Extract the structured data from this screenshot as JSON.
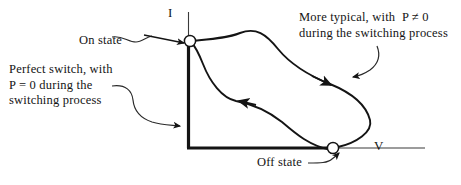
{
  "figure": {
    "type": "iv-switching-trajectory-diagram",
    "background_color": "#ffffff",
    "ink_color": "#141414",
    "axes": {
      "vertical_label": "I",
      "horizontal_label": "V",
      "origin_px": [
        188,
        148
      ],
      "vertical_top_px": [
        188,
        12
      ],
      "horizontal_right_px": [
        425,
        148
      ]
    },
    "markers": [
      {
        "name": "on-state",
        "label": "On state",
        "position_px": [
          190,
          41
        ],
        "style": "hollow-circle"
      },
      {
        "name": "off-state",
        "label": "Off state",
        "position_px": [
          333,
          148
        ],
        "style": "hollow-circle"
      }
    ],
    "annotations": [
      {
        "name": "perfect-switch",
        "lines": [
          "Perfect switch, with",
          "P = 0 during the",
          "switching process"
        ],
        "text": "Perfect switch, with\nP = 0 during the\nswitching process",
        "points_to": "perfect-switch-path-along-axes"
      },
      {
        "name": "more-typical",
        "lines": [
          "More typical, with  P ≠ 0",
          "during the switching process"
        ],
        "text": "More typical, with  P ≠ 0\nduring the switching process",
        "points_to": "curved-switching-trajectory"
      }
    ],
    "curves": [
      {
        "name": "upper-switching-curve",
        "description": "trajectory from On state marker sweeping right and down to Off state marker",
        "direction": "on-state-to-off-state",
        "arrow_px": [
          326,
          83
        ]
      },
      {
        "name": "lower-switching-curve",
        "description": "return trajectory from Off state marker back up-left to On state marker",
        "direction": "off-state-to-on-state",
        "arrow_px": [
          240,
          101
        ]
      }
    ],
    "leader_lines": [
      {
        "name": "on-state-leader",
        "from_px": [
          110,
          38
        ],
        "to_px": [
          183,
          42
        ]
      },
      {
        "name": "off-state-leader",
        "from_px": [
          310,
          162
        ],
        "to_px": [
          339,
          156
        ]
      },
      {
        "name": "perfect-switch-leader",
        "from_px": [
          112,
          85
        ],
        "to_px": [
          186,
          126
        ]
      },
      {
        "name": "more-typical-leader",
        "from_px": [
          376,
          48
        ],
        "to_px": [
          351,
          76
        ]
      }
    ]
  }
}
